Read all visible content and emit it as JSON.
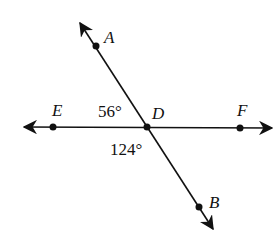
{
  "diagram": {
    "type": "intersecting-lines",
    "points": {
      "A": {
        "label": "A",
        "x": 96,
        "y": 46
      },
      "B": {
        "label": "B",
        "x": 199,
        "y": 207
      },
      "D": {
        "label": "D",
        "x": 147,
        "y": 127
      },
      "E": {
        "label": "E",
        "x": 53,
        "y": 127
      },
      "F": {
        "label": "F",
        "x": 240,
        "y": 128
      }
    },
    "angles": [
      {
        "label": "56°",
        "between": "ADE"
      },
      {
        "label": "124°",
        "between": "EDB"
      }
    ],
    "colors": {
      "line": "#111111",
      "background": "#ffffff"
    }
  }
}
